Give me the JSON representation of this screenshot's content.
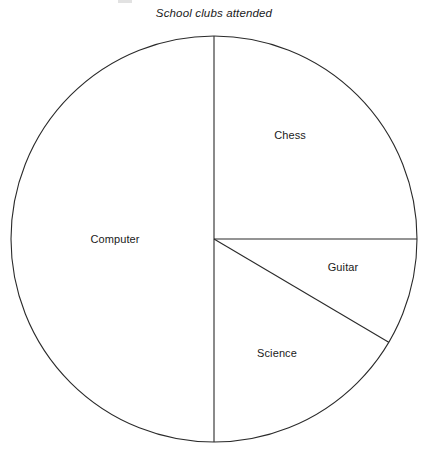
{
  "figure": {
    "title": "School clubs attended",
    "background_color": "#ffffff",
    "stroke_color": "#2a2a2a",
    "text_color": "#1a1a1a"
  },
  "chart_data": {
    "type": "pie",
    "title": "School clubs attended",
    "xlabel": "",
    "ylabel": "",
    "grid": false,
    "legend": "none",
    "labels_position": "inside-slices",
    "fill": "none",
    "start_angle_deg": 0,
    "direction": "clockwise",
    "center_px": [
      214,
      239
    ],
    "radius_px": 203,
    "categories": [
      "Chess",
      "Guitar",
      "Science",
      "Computer"
    ],
    "values": [
      25,
      8.3,
      16.7,
      50
    ],
    "units": "percent",
    "slices": [
      {
        "label": "Chess",
        "value": 25,
        "angle_deg": 90,
        "start_angle_deg": 0,
        "end_angle_deg": 90,
        "label_x": 290,
        "label_y": 135
      },
      {
        "label": "Guitar",
        "value": 8.3,
        "angle_deg": 30,
        "start_angle_deg": 90,
        "end_angle_deg": 120.6,
        "label_x": 343,
        "label_y": 267
      },
      {
        "label": "Science",
        "value": 16.7,
        "angle_deg": 60,
        "start_angle_deg": 120.6,
        "end_angle_deg": 180,
        "label_x": 277,
        "label_y": 353
      },
      {
        "label": "Computer",
        "value": 50,
        "angle_deg": 180,
        "start_angle_deg": 180,
        "end_angle_deg": 360,
        "label_x": 115,
        "label_y": 239
      }
    ]
  }
}
